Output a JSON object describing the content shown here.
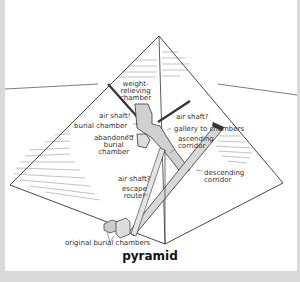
{
  "caption": "pyramid",
  "labels": {
    "weight_relieving_chamber": [
      "weight-",
      "relieving",
      "chamber"
    ],
    "air_shaft_left": "air shaft!",
    "air_shaft_right": "air shaft?",
    "burial_chamber": "burial chamber",
    "gallery_to_chambers": "gallery to chambers",
    "abandoned_burial_chamber": [
      "abandoned",
      "burial",
      "chamber"
    ],
    "ascending_corridor": [
      "ascending",
      "corridor"
    ],
    "air_shaft_lower": "air shaft?",
    "escape_route": [
      "escape",
      "route!"
    ],
    "descending_corridor": [
      "descending",
      "corridor"
    ],
    "original_burial_chambers": "original burial chambers"
  },
  "colors": {
    "background": "#ffffff",
    "frame": "#d9d9d9",
    "line": "#333333",
    "corridor_fill": "#cfcfcf"
  }
}
